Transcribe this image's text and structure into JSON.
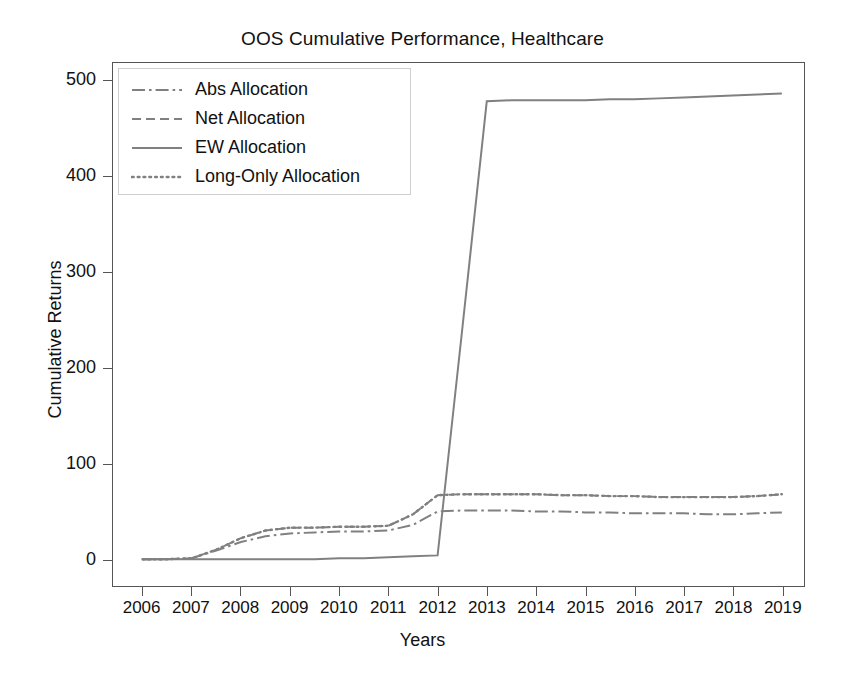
{
  "chart_data": {
    "type": "line",
    "title": "OOS Cumulative Performance, Healthcare",
    "xlabel": "Years",
    "ylabel": "Cumulative Returns",
    "grid": false,
    "legend_position": "upper-left",
    "line_color": "#808080",
    "axis_color": "#555555",
    "xlim": [
      2005.4,
      2019.45
    ],
    "ylim": [
      -28,
      519
    ],
    "xticks": [
      2006,
      2007,
      2008,
      2009,
      2010,
      2011,
      2012,
      2013,
      2014,
      2015,
      2016,
      2017,
      2018,
      2019
    ],
    "xtick_labels": [
      "2006",
      "2007",
      "2008",
      "2009",
      "2010",
      "2011",
      "2012",
      "2013",
      "2014",
      "2015",
      "2016",
      "2017",
      "2018",
      "2019"
    ],
    "yticks": [
      0,
      100,
      200,
      300,
      400,
      500
    ],
    "ytick_labels": [
      "0",
      "100",
      "200",
      "300",
      "400",
      "500"
    ],
    "x": [
      2006,
      2006.5,
      2007,
      2007.5,
      2008,
      2008.5,
      2009,
      2009.5,
      2010,
      2010.5,
      2011,
      2011.5,
      2012,
      2012.5,
      2013,
      2013.5,
      2014,
      2014.5,
      2015,
      2015.5,
      2016,
      2016.5,
      2017,
      2017.5,
      2018,
      2018.5,
      2019
    ],
    "series": [
      {
        "name": "Abs Allocation",
        "dash": "dash-dot",
        "values": [
          0,
          0,
          1,
          9,
          18,
          24,
          27,
          28,
          29,
          29,
          30,
          36,
          50,
          51,
          51,
          51,
          50,
          50,
          49,
          49,
          48,
          48,
          48,
          47,
          47,
          48,
          49
        ]
      },
      {
        "name": "Net Allocation",
        "dash": "dashed",
        "values": [
          0,
          0,
          1,
          10,
          22,
          30,
          33,
          33,
          34,
          34,
          35,
          47,
          67,
          68,
          68,
          68,
          68,
          67,
          67,
          66,
          66,
          65,
          65,
          65,
          65,
          66,
          68
        ]
      },
      {
        "name": "EW Allocation",
        "dash": "solid",
        "values": [
          0,
          0,
          0,
          0,
          0,
          0,
          0,
          0,
          1,
          1,
          2,
          3,
          4,
          240,
          479,
          480,
          480,
          480,
          480,
          481,
          481,
          482,
          483,
          484,
          485,
          486,
          487
        ]
      },
      {
        "name": "Long-Only Allocation",
        "dash": "dotted",
        "values": [
          0,
          0,
          1,
          10,
          22,
          30,
          33,
          33,
          34,
          34,
          35,
          47,
          67,
          68,
          68,
          68,
          68,
          67,
          67,
          66,
          66,
          65,
          65,
          65,
          65,
          66,
          68
        ]
      }
    ]
  },
  "legend": {
    "items": [
      {
        "label": "Abs Allocation"
      },
      {
        "label": "Net Allocation"
      },
      {
        "label": "EW Allocation"
      },
      {
        "label": "Long-Only Allocation"
      }
    ]
  }
}
